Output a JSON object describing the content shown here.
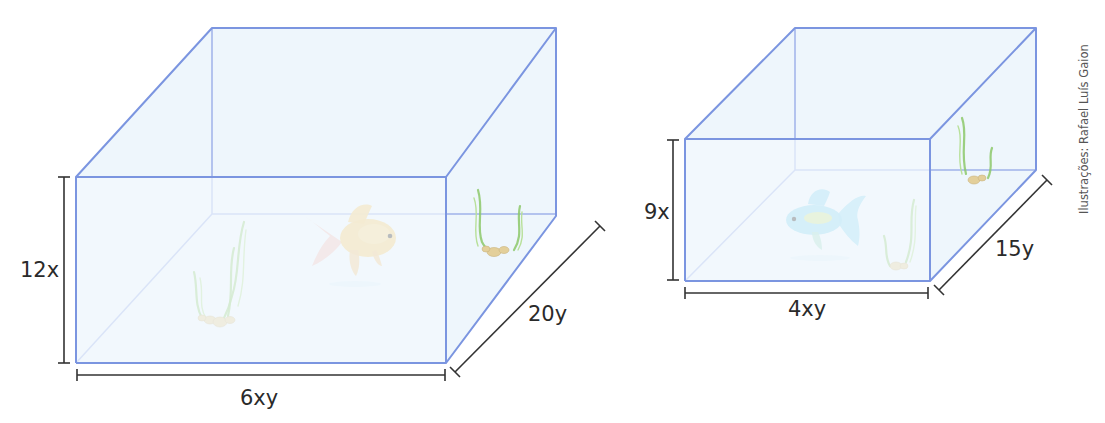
{
  "figure": {
    "aquariums": [
      {
        "id": "large",
        "height_label": "12x",
        "width_label": "6xy",
        "depth_label": "20y",
        "fish_color": "#f3c96b",
        "fish_fin_color": "#f1b9b0"
      },
      {
        "id": "small",
        "height_label": "9x",
        "width_label": "4xy",
        "depth_label": "15y",
        "fish_color": "#86d3ee",
        "fish_fin_color": "#d6e884"
      }
    ],
    "credit": "Ilustrações: Rafael Luís Gaion",
    "colors": {
      "glass_edge": "#7b95e0",
      "glass_fill": "#eef6fc",
      "dimension_line": "#333333",
      "plant": "#8cc86a",
      "pebble": "#e3cf9a"
    }
  }
}
